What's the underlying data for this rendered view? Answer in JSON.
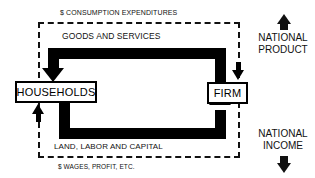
{
  "diagram": {
    "background_color": "#ffffff",
    "line_color": "#000000"
  },
  "entities": {
    "households": {
      "label": "HOUSEHOLDS"
    },
    "firm": {
      "label": "FIRM"
    }
  },
  "flows": {
    "consumption_expenditures": {
      "label": "$ CONSUMPTION EXPENDITURES",
      "style": "dashed",
      "direction": "households-to-firm"
    },
    "goods_and_services": {
      "label": "GOODS AND SERVICES",
      "style": "solid-thick",
      "direction": "firm-to-households"
    },
    "land_labor_capital": {
      "label": "LAND, LABOR AND CAPITAL",
      "style": "solid-thick",
      "direction": "households-to-firm"
    },
    "wages_profit": {
      "label": "$ WAGES, PROFIT, ETC.",
      "style": "dashed",
      "direction": "firm-to-households"
    }
  },
  "aggregates": {
    "national_product": {
      "line1": "NATIONAL",
      "line2": "PRODUCT",
      "arrow": "up-arrow-icon"
    },
    "national_income": {
      "line1": "NATIONAL",
      "line2": "INCOME",
      "arrow": "down-arrow-icon"
    }
  }
}
